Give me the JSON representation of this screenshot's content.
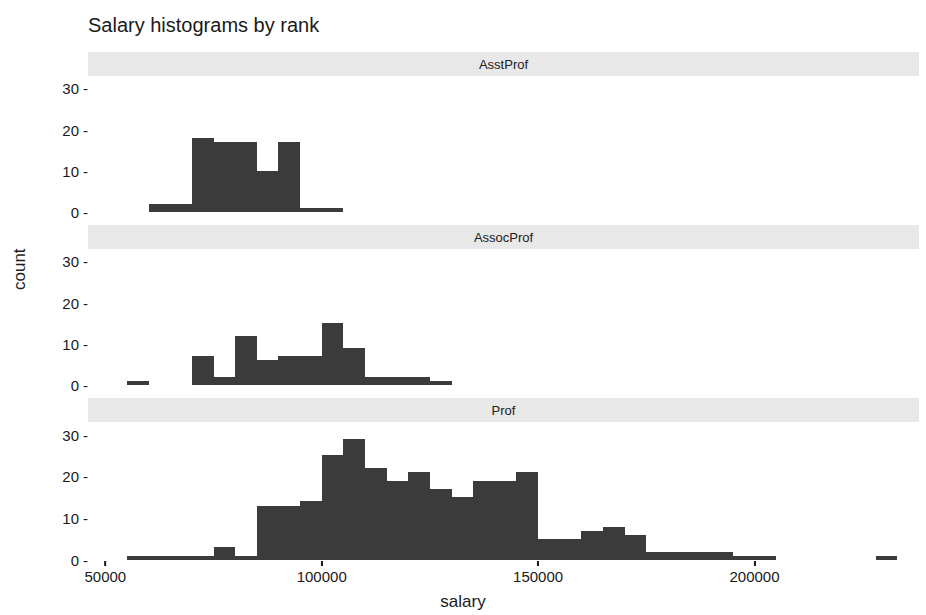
{
  "chart_data": {
    "type": "bar",
    "title": "Salary histograms by rank",
    "xlabel": "salary",
    "ylabel": "count",
    "xlim": [
      46000,
      238000
    ],
    "ylim": [
      0,
      33
    ],
    "xticks": [
      50000,
      100000,
      150000,
      200000
    ],
    "xticklabels": [
      "50000",
      "100000",
      "150000",
      "200000"
    ],
    "yticks": [
      0,
      10,
      20,
      30
    ],
    "yticklabels": [
      "0",
      "10",
      "20",
      "30"
    ],
    "grid": false,
    "legend": null,
    "bin_width": 5000,
    "bar_color": "#3b3b3b",
    "strip_color": "#e8e8e8",
    "facets": [
      {
        "label": "AsstProf",
        "bins": [
          {
            "x0": 60000,
            "x1": 65000,
            "count": 2
          },
          {
            "x0": 65000,
            "x1": 70000,
            "count": 2
          },
          {
            "x0": 70000,
            "x1": 75000,
            "count": 18
          },
          {
            "x0": 75000,
            "x1": 80000,
            "count": 17
          },
          {
            "x0": 80000,
            "x1": 85000,
            "count": 17
          },
          {
            "x0": 85000,
            "x1": 90000,
            "count": 10
          },
          {
            "x0": 90000,
            "x1": 95000,
            "count": 17
          },
          {
            "x0": 95000,
            "x1": 100000,
            "count": 1
          },
          {
            "x0": 100000,
            "x1": 105000,
            "count": 1
          }
        ]
      },
      {
        "label": "AssocProf",
        "bins": [
          {
            "x0": 55000,
            "x1": 60000,
            "count": 1
          },
          {
            "x0": 70000,
            "x1": 75000,
            "count": 7
          },
          {
            "x0": 75000,
            "x1": 80000,
            "count": 2
          },
          {
            "x0": 80000,
            "x1": 85000,
            "count": 12
          },
          {
            "x0": 85000,
            "x1": 90000,
            "count": 6
          },
          {
            "x0": 90000,
            "x1": 95000,
            "count": 7
          },
          {
            "x0": 95000,
            "x1": 100000,
            "count": 7
          },
          {
            "x0": 100000,
            "x1": 105000,
            "count": 15
          },
          {
            "x0": 105000,
            "x1": 110000,
            "count": 9
          },
          {
            "x0": 110000,
            "x1": 115000,
            "count": 2
          },
          {
            "x0": 115000,
            "x1": 120000,
            "count": 2
          },
          {
            "x0": 120000,
            "x1": 125000,
            "count": 2
          },
          {
            "x0": 125000,
            "x1": 130000,
            "count": 1
          }
        ]
      },
      {
        "label": "Prof",
        "bins": [
          {
            "x0": 55000,
            "x1": 60000,
            "count": 1
          },
          {
            "x0": 60000,
            "x1": 65000,
            "count": 1
          },
          {
            "x0": 65000,
            "x1": 70000,
            "count": 1
          },
          {
            "x0": 70000,
            "x1": 75000,
            "count": 1
          },
          {
            "x0": 75000,
            "x1": 80000,
            "count": 3
          },
          {
            "x0": 80000,
            "x1": 85000,
            "count": 1
          },
          {
            "x0": 85000,
            "x1": 90000,
            "count": 13
          },
          {
            "x0": 90000,
            "x1": 95000,
            "count": 13
          },
          {
            "x0": 95000,
            "x1": 100000,
            "count": 14
          },
          {
            "x0": 100000,
            "x1": 105000,
            "count": 25
          },
          {
            "x0": 105000,
            "x1": 110000,
            "count": 29
          },
          {
            "x0": 110000,
            "x1": 115000,
            "count": 22
          },
          {
            "x0": 115000,
            "x1": 120000,
            "count": 19
          },
          {
            "x0": 120000,
            "x1": 125000,
            "count": 21
          },
          {
            "x0": 125000,
            "x1": 130000,
            "count": 17
          },
          {
            "x0": 130000,
            "x1": 135000,
            "count": 15
          },
          {
            "x0": 135000,
            "x1": 140000,
            "count": 19
          },
          {
            "x0": 140000,
            "x1": 145000,
            "count": 19
          },
          {
            "x0": 145000,
            "x1": 150000,
            "count": 21
          },
          {
            "x0": 150000,
            "x1": 155000,
            "count": 5
          },
          {
            "x0": 155000,
            "x1": 160000,
            "count": 5
          },
          {
            "x0": 160000,
            "x1": 165000,
            "count": 7
          },
          {
            "x0": 165000,
            "x1": 170000,
            "count": 8
          },
          {
            "x0": 170000,
            "x1": 175000,
            "count": 6
          },
          {
            "x0": 175000,
            "x1": 180000,
            "count": 2
          },
          {
            "x0": 180000,
            "x1": 185000,
            "count": 2
          },
          {
            "x0": 185000,
            "x1": 190000,
            "count": 2
          },
          {
            "x0": 190000,
            "x1": 195000,
            "count": 2
          },
          {
            "x0": 195000,
            "x1": 200000,
            "count": 1
          },
          {
            "x0": 200000,
            "x1": 205000,
            "count": 1
          },
          {
            "x0": 228000,
            "x1": 233000,
            "count": 1
          }
        ]
      }
    ]
  }
}
